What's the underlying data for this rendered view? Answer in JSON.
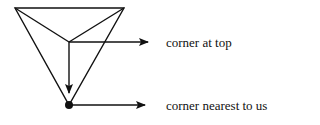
{
  "diagram": {
    "type": "pyramid-vertex-labels",
    "colors": {
      "stroke": "#111111",
      "background": "#ffffff"
    },
    "labels": {
      "top": "corner at top",
      "nearest": "corner nearest to us"
    }
  }
}
